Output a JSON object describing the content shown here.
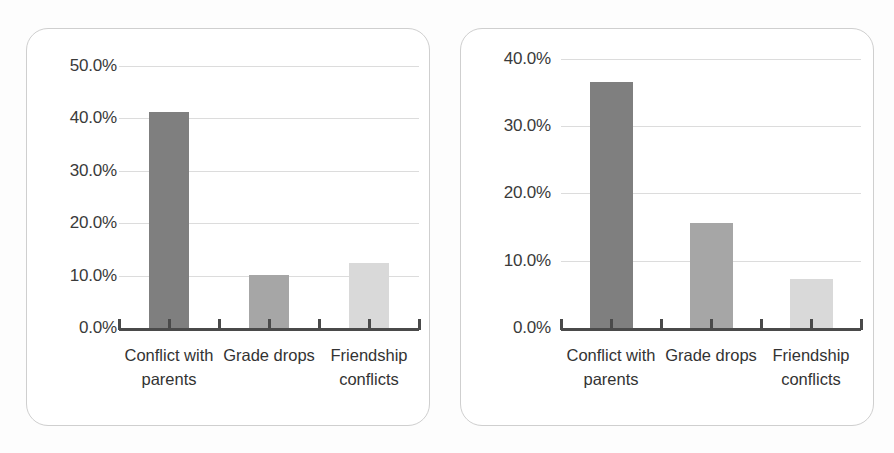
{
  "figure": {
    "panel_count": 2,
    "background_color": "#ffffff",
    "panel_border_color": "#cfcfcf",
    "gridline_color": "#dcdcdc",
    "axis_color": "#4a4a4a",
    "tick_label_color": "#3a3a3a"
  },
  "chart_data": [
    {
      "panel": "left",
      "type": "bar",
      "title": "",
      "subtitle": "",
      "xlabel": "",
      "ylabel": "",
      "categories": [
        "Conflict with\nparents",
        "Grade drops",
        "Friendship\nconflicts"
      ],
      "categories_flat": [
        "Conflict with parents",
        "Grade drops",
        "Friendship conflicts"
      ],
      "values": [
        41.3,
        10.2,
        12.4
      ],
      "value_labels": [
        "41.3%",
        "10.2%",
        "12.4%"
      ],
      "ylim": [
        0,
        50
      ],
      "ytick_labels": [
        "50.0%",
        "40.0%",
        "30.0%",
        "20.0%",
        "10.0%",
        "0.0%"
      ],
      "ytick_values": [
        50,
        40,
        30,
        20,
        10,
        0
      ],
      "grid": true,
      "grid_axis": "y",
      "legend": false,
      "legend_position": "none",
      "bar_colors": [
        "#7f7f7f",
        "#a6a6a6",
        "#d9d9d9"
      ]
    },
    {
      "panel": "right",
      "type": "bar",
      "title": "",
      "subtitle": "",
      "xlabel": "",
      "ylabel": "",
      "categories": [
        "Conflict with\nparents",
        "Grade drops",
        "Friendship\nconflicts"
      ],
      "categories_flat": [
        "Conflict with parents",
        "Grade drops",
        "Friendship conflicts"
      ],
      "values": [
        36.5,
        15.6,
        7.3
      ],
      "value_labels": [
        "36.5%",
        "15.6%",
        "7.3%"
      ],
      "ylim": [
        0,
        40
      ],
      "ytick_labels": [
        "40.0%",
        "30.0%",
        "20.0%",
        "10.0%",
        "0.0%"
      ],
      "ytick_values": [
        40,
        30,
        20,
        10,
        0
      ],
      "grid": true,
      "grid_axis": "y",
      "legend": false,
      "legend_position": "none",
      "bar_colors": [
        "#7f7f7f",
        "#a6a6a6",
        "#d9d9d9"
      ]
    }
  ]
}
